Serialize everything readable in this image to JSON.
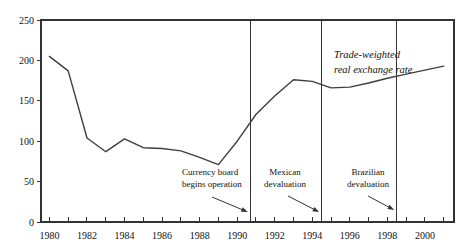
{
  "chart_data": {
    "type": "line",
    "title": "",
    "series_label_lines": [
      "Trade-weighted",
      "real exchange rate"
    ],
    "x": [
      1980,
      1981,
      1982,
      1983,
      1984,
      1985,
      1986,
      1987,
      1988,
      1989,
      1990,
      1991,
      1992,
      1993,
      1994,
      1995,
      1996,
      1997,
      1998,
      1999,
      2000,
      2001
    ],
    "values": [
      205,
      187,
      104,
      87,
      103,
      92,
      91,
      88,
      80,
      71,
      100,
      133,
      156,
      176,
      174,
      166,
      167,
      172,
      178,
      183,
      188,
      193
    ],
    "xlim": [
      1979.55,
      2001.55
    ],
    "ylim": [
      0,
      250
    ],
    "y_ticks": [
      0,
      50,
      100,
      150,
      200,
      250
    ],
    "x_tick_labels": [
      "1980",
      "1982",
      "1984",
      "1986",
      "1988",
      "1990",
      "1992",
      "1994",
      "1996",
      "1998",
      "2000"
    ],
    "minor_tick_interval_years": 1,
    "grid": "off",
    "frame": "box",
    "events": [
      {
        "label_lines": [
          "Currency board",
          "begins operation"
        ],
        "year": 1990.7
      },
      {
        "label_lines": [
          "Mexican",
          "devaluation"
        ],
        "year": 1994.5
      },
      {
        "label_lines": [
          "Brazilian",
          "devaluation"
        ],
        "year": 1998.5
      }
    ],
    "colors": {
      "line": "#3f3f3f",
      "frame": "#333333",
      "text": "#111111"
    }
  }
}
